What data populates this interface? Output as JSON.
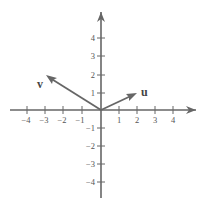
{
  "diagram": {
    "type": "vector-plot",
    "axes": {
      "x_ticks": [
        "−4",
        "−3",
        "−2",
        "−1",
        "1",
        "2",
        "3",
        "4"
      ],
      "y_ticks": [
        "4",
        "3",
        "2",
        "1",
        "−1",
        "−2",
        "−3",
        "−4"
      ]
    },
    "vectors": [
      {
        "name": "v",
        "from": [
          0,
          0
        ],
        "to": [
          -3,
          2
        ]
      },
      {
        "name": "u",
        "from": [
          0,
          0
        ],
        "to": [
          2,
          1
        ]
      }
    ],
    "colors": {
      "axis": "#666666",
      "vector": "#666666",
      "text": "#555555"
    }
  }
}
